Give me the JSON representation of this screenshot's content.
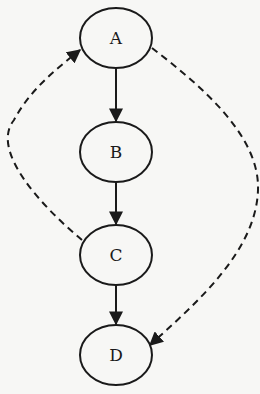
{
  "diagram": {
    "type": "directed-graph",
    "nodes": [
      {
        "id": "A",
        "label": "A",
        "cx": 116,
        "cy": 38
      },
      {
        "id": "B",
        "label": "B",
        "cx": 116,
        "cy": 152
      },
      {
        "id": "C",
        "label": "C",
        "cx": 116,
        "cy": 255
      },
      {
        "id": "D",
        "label": "D",
        "cx": 116,
        "cy": 355
      }
    ],
    "edges": [
      {
        "from": "A",
        "to": "B",
        "style": "solid"
      },
      {
        "from": "B",
        "to": "C",
        "style": "solid"
      },
      {
        "from": "C",
        "to": "D",
        "style": "solid"
      },
      {
        "from": "C",
        "to": "A",
        "style": "dashed"
      },
      {
        "from": "A",
        "to": "D",
        "style": "dashed"
      }
    ],
    "colors": {
      "stroke": "#1a1a1a",
      "background": "#f7f7f5"
    }
  }
}
